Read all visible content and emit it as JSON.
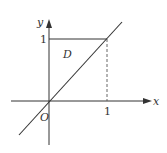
{
  "diagram": {
    "axes": {
      "x_label": "x",
      "y_label": "y",
      "origin_label": "O"
    },
    "ticks": {
      "x_tick": "1",
      "y_tick": "1"
    },
    "region_label": "D",
    "colors": {
      "stroke": "#333333",
      "background": "#ffffff"
    },
    "elements": [
      "x-axis with arrow",
      "y-axis with arrow",
      "line y = x through origin",
      "horizontal segment y = 1 from x = 0 to x = 1",
      "dashed vertical segment x = 1 from y = 0 to y = 1",
      "region D bounded by y-axis, y = 1 and y = x"
    ]
  }
}
